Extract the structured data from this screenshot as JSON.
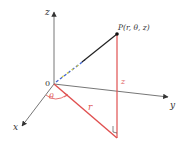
{
  "diagram": {
    "type": "cylindrical-coordinates",
    "axes": {
      "z_label": "z",
      "y_label": "y",
      "x_label": "x",
      "origin_label": "0"
    },
    "point": {
      "label": "P(r, θ, z)"
    },
    "segments": {
      "height_label": "z",
      "radius_label": "r",
      "angle_label": "θ"
    },
    "colors": {
      "axis": "#555555",
      "red": "#e05050",
      "op_line": "#222222"
    }
  }
}
